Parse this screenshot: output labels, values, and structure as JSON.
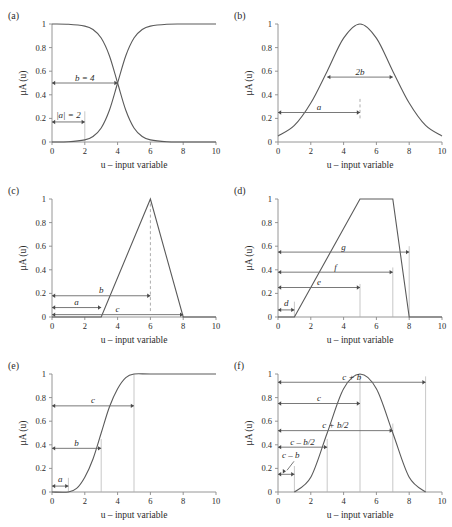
{
  "figure": {
    "axis_label_x": "u – input variable",
    "axis_label_y": "μA (u)",
    "y_tick_labels": [
      "0",
      "0.2",
      "0.4",
      "0.6",
      "0.8",
      "1"
    ],
    "x_tick_labels": [
      "0",
      "2",
      "4",
      "6",
      "8",
      "10"
    ],
    "panels": [
      {
        "id": "a",
        "label": "(a)",
        "annotations": [
          {
            "text": "b = 4"
          },
          {
            "text": "|a| = 2"
          }
        ]
      },
      {
        "id": "b",
        "label": "(b)",
        "annotations": [
          {
            "text": "2b"
          },
          {
            "text": "a"
          }
        ]
      },
      {
        "id": "c",
        "label": "(c)",
        "annotations": [
          {
            "text": "b"
          },
          {
            "text": "a"
          },
          {
            "text": "c"
          }
        ]
      },
      {
        "id": "d",
        "label": "(d)",
        "annotations": [
          {
            "text": "g"
          },
          {
            "text": "f"
          },
          {
            "text": "e"
          },
          {
            "text": "d"
          }
        ]
      },
      {
        "id": "e",
        "label": "(e)",
        "annotations": [
          {
            "text": "c"
          },
          {
            "text": "b"
          },
          {
            "text": "a"
          }
        ]
      },
      {
        "id": "f",
        "label": "(f)",
        "annotations": [
          {
            "text": "c + b"
          },
          {
            "text": "c"
          },
          {
            "text": "c + b/2"
          },
          {
            "text": "c – b/2"
          },
          {
            "text": "c – b"
          }
        ]
      }
    ]
  },
  "chart_data": [
    {
      "type": "line",
      "panel": "a",
      "title": "(a)",
      "xlabel": "u – input variable",
      "ylabel": "μA (u)",
      "xlim": [
        0,
        10
      ],
      "ylim": [
        0,
        1
      ],
      "xticks": [
        0,
        2,
        4,
        6,
        8,
        10
      ],
      "yticks": [
        0,
        0.2,
        0.4,
        0.6,
        0.8,
        1
      ],
      "grid": false,
      "legend": "none",
      "series": [
        {
          "name": "decreasing-sigmoid",
          "description": "1/(1+exp(2*(u-4)))",
          "x": [
            0,
            1,
            2,
            2.5,
            3,
            3.5,
            4,
            4.5,
            5,
            5.5,
            6,
            7,
            8,
            9,
            10
          ],
          "y": [
            1.0,
            0.998,
            0.982,
            0.953,
            0.881,
            0.731,
            0.5,
            0.269,
            0.119,
            0.047,
            0.018,
            0.002,
            0.0,
            0.0,
            0.0
          ]
        },
        {
          "name": "increasing-sigmoid",
          "description": "1/(1+exp(-2*(u-4)))",
          "x": [
            0,
            1,
            2,
            2.5,
            3,
            3.5,
            4,
            4.5,
            5,
            5.5,
            6,
            7,
            8,
            9,
            10
          ],
          "y": [
            0.0,
            0.002,
            0.018,
            0.047,
            0.119,
            0.269,
            0.5,
            0.731,
            0.881,
            0.953,
            0.982,
            0.998,
            1.0,
            1.0,
            1.0
          ]
        }
      ],
      "annotations": [
        {
          "text": "b = 4",
          "type": "double-arrow",
          "x_from": 0,
          "x_to": 4,
          "y": 0.5
        },
        {
          "text": "|a| = 2",
          "type": "double-arrow",
          "x_from": 0,
          "x_to": 2,
          "y": 0.17
        },
        {
          "text": "",
          "type": "vertical-guide",
          "x": 2,
          "y_from": 0,
          "y_to": 0.26
        }
      ]
    },
    {
      "type": "line",
      "panel": "b",
      "title": "(b)",
      "xlabel": "u – input variable",
      "ylabel": "μA (u)",
      "xlim": [
        0,
        10
      ],
      "ylim": [
        0,
        1
      ],
      "xticks": [
        0,
        2,
        4,
        6,
        8,
        10
      ],
      "yticks": [
        0,
        0.2,
        0.4,
        0.6,
        0.8,
        1
      ],
      "grid": false,
      "legend": "none",
      "series": [
        {
          "name": "gaussian",
          "description": "exp(-((u-5)^2)/(2*2.1^2)) bell centered at 5",
          "x": [
            0,
            1,
            2,
            3,
            4,
            5,
            6,
            7,
            8,
            9,
            10
          ],
          "y": [
            0.05,
            0.14,
            0.33,
            0.6,
            0.88,
            1.0,
            0.88,
            0.6,
            0.33,
            0.14,
            0.05
          ]
        }
      ],
      "annotations": [
        {
          "text": "2b",
          "type": "double-arrow",
          "x_from": 3,
          "x_to": 7,
          "y": 0.55
        },
        {
          "text": "a",
          "type": "double-arrow",
          "x_from": 0,
          "x_to": 5,
          "y": 0.25
        },
        {
          "text": "",
          "type": "vertical-guide-dashed",
          "x": 5,
          "y_from": 0.2,
          "y_to": 0.37
        }
      ]
    },
    {
      "type": "line",
      "panel": "c",
      "title": "(c)",
      "xlabel": "u – input variable",
      "ylabel": "μA (u)",
      "xlim": [
        0,
        10
      ],
      "ylim": [
        0,
        1
      ],
      "xticks": [
        0,
        2,
        4,
        6,
        8,
        10
      ],
      "yticks": [
        0,
        0.2,
        0.4,
        0.6,
        0.8,
        1
      ],
      "grid": false,
      "legend": "none",
      "series": [
        {
          "name": "triangular",
          "description": "triangle rising 3->6, falling 6->8",
          "x": [
            0,
            3,
            6,
            8,
            10
          ],
          "y": [
            0,
            0,
            1,
            0,
            0
          ]
        }
      ],
      "annotations": [
        {
          "text": "b",
          "type": "double-arrow",
          "x_from": 0,
          "x_to": 6,
          "y": 0.18
        },
        {
          "text": "a",
          "type": "double-arrow",
          "x_from": 0,
          "x_to": 3,
          "y": 0.08
        },
        {
          "text": "c",
          "type": "double-arrow",
          "x_from": 0,
          "x_to": 8,
          "y": 0.02
        },
        {
          "text": "",
          "type": "vertical-guide-dashed",
          "x": 6,
          "y_from": 0.05,
          "y_to": 1.0
        }
      ]
    },
    {
      "type": "line",
      "panel": "d",
      "title": "(d)",
      "xlabel": "u – input variable",
      "ylabel": "μA (u)",
      "xlim": [
        0,
        10
      ],
      "ylim": [
        0,
        1
      ],
      "xticks": [
        0,
        2,
        4,
        6,
        8,
        10
      ],
      "yticks": [
        0,
        0.2,
        0.4,
        0.6,
        0.8,
        1
      ],
      "grid": false,
      "legend": "none",
      "series": [
        {
          "name": "trapezoidal",
          "description": "trapezoid rising 1->5, plateau 5->7, falling 7->8",
          "x": [
            0,
            1,
            5,
            7,
            8,
            10
          ],
          "y": [
            0,
            0,
            1,
            1,
            0,
            0
          ]
        }
      ],
      "annotations": [
        {
          "text": "g",
          "type": "double-arrow",
          "x_from": 0,
          "x_to": 8,
          "y": 0.55
        },
        {
          "text": "f",
          "type": "double-arrow",
          "x_from": 0,
          "x_to": 7,
          "y": 0.38
        },
        {
          "text": "e",
          "type": "double-arrow",
          "x_from": 0,
          "x_to": 5,
          "y": 0.25
        },
        {
          "text": "d",
          "type": "double-arrow",
          "x_from": 0,
          "x_to": 1,
          "y": 0.06
        },
        {
          "text": "",
          "type": "vertical-guide",
          "x": 1,
          "y_from": 0,
          "y_to": 0.13
        },
        {
          "text": "",
          "type": "vertical-guide",
          "x": 5,
          "y_from": 0,
          "y_to": 0.28
        },
        {
          "text": "",
          "type": "vertical-guide",
          "x": 7,
          "y_from": 0,
          "y_to": 0.42
        },
        {
          "text": "",
          "type": "vertical-guide",
          "x": 8,
          "y_from": 0,
          "y_to": 0.6
        }
      ]
    },
    {
      "type": "line",
      "panel": "e",
      "title": "(e)",
      "xlabel": "u – input variable",
      "ylabel": "μA (u)",
      "xlim": [
        0,
        10
      ],
      "ylim": [
        0,
        1
      ],
      "xticks": [
        0,
        2,
        4,
        6,
        8,
        10
      ],
      "yticks": [
        0,
        0.2,
        0.4,
        0.6,
        0.8,
        1
      ],
      "grid": false,
      "legend": "none",
      "series": [
        {
          "name": "s-function",
          "description": "S-curve zero until 1, reaches 1 at 5, inflection at 3",
          "x": [
            0,
            1,
            1.5,
            2,
            2.5,
            3,
            3.5,
            4,
            4.5,
            5,
            6,
            8,
            10
          ],
          "y": [
            0,
            0,
            0.03,
            0.125,
            0.28,
            0.5,
            0.72,
            0.875,
            0.97,
            1.0,
            1.0,
            1.0,
            1.0
          ]
        }
      ],
      "annotations": [
        {
          "text": "c",
          "type": "double-arrow",
          "x_from": 0,
          "x_to": 5,
          "y": 0.73
        },
        {
          "text": "b",
          "type": "double-arrow",
          "x_from": 0,
          "x_to": 3,
          "y": 0.37
        },
        {
          "text": "a",
          "type": "double-arrow",
          "x_from": 0,
          "x_to": 1,
          "y": 0.05
        },
        {
          "text": "",
          "type": "vertical-guide",
          "x": 1,
          "y_from": 0,
          "y_to": 0.12
        },
        {
          "text": "",
          "type": "vertical-guide",
          "x": 3,
          "y_from": 0,
          "y_to": 0.45
        },
        {
          "text": "",
          "type": "vertical-guide",
          "x": 5,
          "y_from": 0,
          "y_to": 1.0
        }
      ]
    },
    {
      "type": "line",
      "panel": "f",
      "title": "(f)",
      "xlabel": "u – input variable",
      "ylabel": "μA (u)",
      "xlim": [
        0,
        10
      ],
      "ylim": [
        0,
        1
      ],
      "xticks": [
        0,
        2,
        4,
        6,
        8,
        10
      ],
      "yticks": [
        0,
        0.2,
        0.4,
        0.6,
        0.8,
        1
      ],
      "grid": false,
      "legend": "none",
      "series": [
        {
          "name": "pi-function",
          "description": "bell centered at 5, zero outside [1,9], half-width b=4",
          "x": [
            1,
            2,
            3,
            4,
            5,
            6,
            7,
            8,
            9
          ],
          "y": [
            0,
            0.125,
            0.5,
            0.875,
            1.0,
            0.875,
            0.5,
            0.125,
            0
          ]
        }
      ],
      "annotations": [
        {
          "text": "c + b",
          "type": "double-arrow",
          "x_from": 0,
          "x_to": 9,
          "y": 0.93
        },
        {
          "text": "c",
          "type": "double-arrow",
          "x_from": 0,
          "x_to": 5,
          "y": 0.75
        },
        {
          "text": "c + b/2",
          "type": "double-arrow",
          "x_from": 0,
          "x_to": 7,
          "y": 0.52
        },
        {
          "text": "c – b/2",
          "type": "double-arrow",
          "x_from": 0,
          "x_to": 3,
          "y": 0.38
        },
        {
          "text": "c – b",
          "type": "double-arrow-with-leader",
          "x_from": 0,
          "x_to": 1,
          "y": 0.15
        },
        {
          "text": "",
          "type": "vertical-guide",
          "x": 1,
          "y_from": 0,
          "y_to": 0.22
        },
        {
          "text": "",
          "type": "vertical-guide",
          "x": 3,
          "y_from": 0,
          "y_to": 0.45
        },
        {
          "text": "",
          "type": "vertical-guide",
          "x": 5,
          "y_from": 0,
          "y_to": 1.0
        },
        {
          "text": "",
          "type": "vertical-guide",
          "x": 7,
          "y_from": 0,
          "y_to": 0.58
        },
        {
          "text": "",
          "type": "vertical-guide",
          "x": 9,
          "y_from": 0,
          "y_to": 0.98
        }
      ]
    }
  ]
}
